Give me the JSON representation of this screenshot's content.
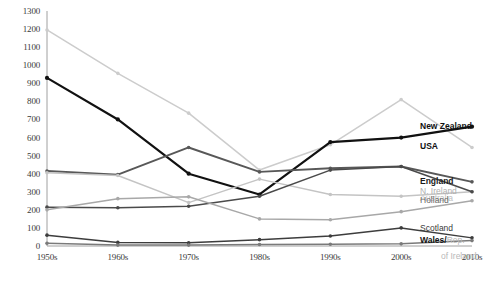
{
  "chart_data": {
    "type": "line",
    "title": "",
    "subtitle": "",
    "xlabel": "",
    "ylabel": "",
    "categories": [
      "1950s",
      "1960s",
      "1970s",
      "1980s",
      "1990s",
      "2000s",
      "2010s"
    ],
    "ylim": [
      0,
      1300
    ],
    "yticks": [
      0,
      100,
      200,
      300,
      400,
      500,
      600,
      700,
      800,
      900,
      1000,
      1100,
      1200,
      1300
    ],
    "grid": false,
    "legend_position": "right-inline-end-of-line",
    "series": [
      {
        "name": "USA",
        "values": [
          1195,
          955,
          735,
          420,
          560,
          810,
          545
        ],
        "color": "#cccccc",
        "label_bold": true,
        "label_color": "#111111"
      },
      {
        "name": "New Zealand",
        "values": [
          930,
          700,
          400,
          285,
          575,
          600,
          660
        ],
        "color": "#111111",
        "label_bold": true,
        "label_color": "#111111"
      },
      {
        "name": "England",
        "values": [
          415,
          395,
          545,
          410,
          430,
          440,
          355
        ],
        "color": "#585858",
        "label_bold": true,
        "label_color": "#1a1a1a"
      },
      {
        "name": "N. Ireland",
        "values": [
          405,
          390,
          240,
          370,
          285,
          275,
          300
        ],
        "color": "#c4c4c4",
        "label_bold": false,
        "label_color": "#b0b0b0"
      },
      {
        "name": "Australia",
        "values": [
          215,
          212,
          220,
          275,
          420,
          440,
          300
        ],
        "color": "#4a4a4a",
        "label_bold": false,
        "label_color": "#c0c0c0"
      },
      {
        "name": "Holland",
        "values": [
          200,
          262,
          272,
          150,
          145,
          190,
          250
        ],
        "color": "#a8a8a8",
        "label_bold": false,
        "label_color": "#6a6a6a"
      },
      {
        "name": "Scotland",
        "values": [
          60,
          20,
          18,
          35,
          55,
          100,
          45
        ],
        "color": "#3d3d3d",
        "label_bold": false,
        "label_color": "#3a3a3a"
      },
      {
        "name": "Wales/",
        "name_continued": "Rep.",
        "name_line2": "of Ireland",
        "values": [
          15,
          5,
          5,
          8,
          10,
          12,
          30
        ],
        "color": "#7a7a7a",
        "label_bold": true,
        "label_color": "#111111"
      }
    ]
  },
  "axis": {
    "y_labels": [
      "1300",
      "1200",
      "1100",
      "1000",
      "900",
      "800",
      "700",
      "600",
      "500",
      "400",
      "300",
      "200",
      "100",
      "0"
    ],
    "x_labels": [
      "1950s",
      "1960s",
      "1970s",
      "1980s",
      "1990s",
      "2000s",
      "2010s"
    ]
  },
  "legend": {
    "new_zealand": "New Zealand",
    "usa": "USA",
    "england": "England",
    "n_ireland": "N. Ireland",
    "australia": "Australia",
    "holland": "Holland",
    "scotland": "Scotland",
    "wales": "Wales/",
    "wales_rep": "Rep.",
    "wales_of_ireland": "of Ireland"
  }
}
